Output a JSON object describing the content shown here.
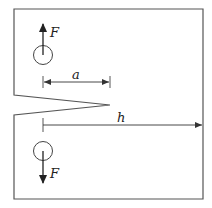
{
  "diagram": {
    "type": "compact-tension-specimen",
    "colors": {
      "stroke": "#444444",
      "background": "#ffffff",
      "text": "#222222"
    },
    "labels": {
      "force_top": "F",
      "force_bottom": "F",
      "crack_length": "a",
      "width": "h"
    }
  }
}
